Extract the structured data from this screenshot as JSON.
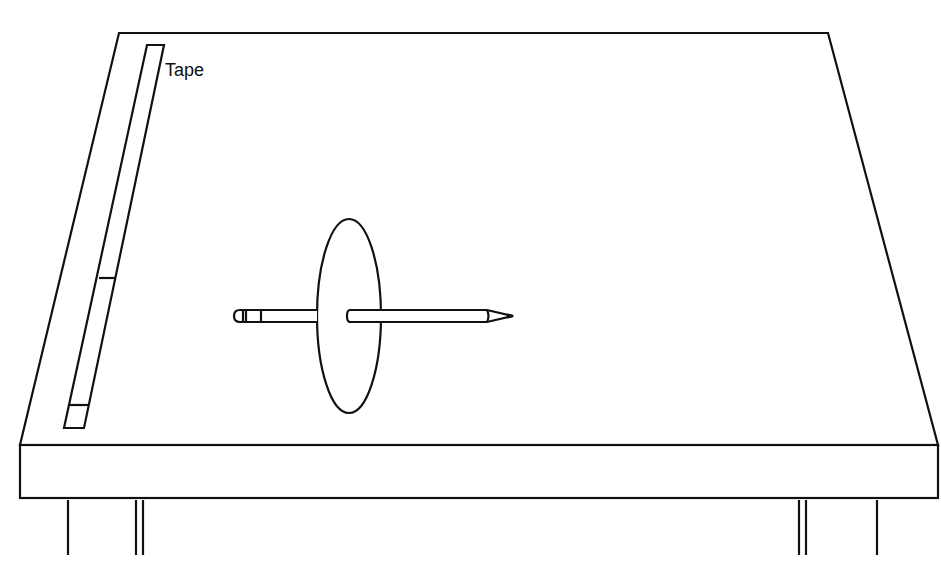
{
  "labels": {
    "tape": "Tape"
  },
  "colors": {
    "stroke": "#111111",
    "background": "#ffffff"
  }
}
